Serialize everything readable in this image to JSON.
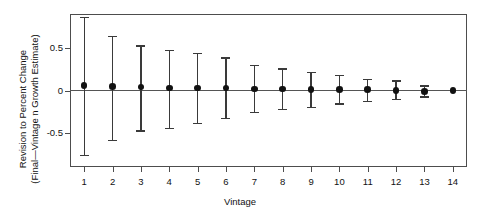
{
  "chart_data": {
    "type": "scatter",
    "title": "",
    "subtitle": "",
    "xlabel": "Vintage",
    "ylabel": "Revision to Percent Change (Final—Vintage n Growth Estimate)",
    "ylabel_line1": "Revision to Percent Change",
    "ylabel_line2": "(Final—Vintage n Growth Estimate)",
    "categories": [
      1,
      2,
      3,
      4,
      5,
      6,
      7,
      8,
      9,
      10,
      11,
      12,
      13,
      14
    ],
    "xtick_labels": [
      "1",
      "2",
      "3",
      "4",
      "5",
      "6",
      "7",
      "8",
      "9",
      "10",
      "11",
      "12",
      "13",
      "14"
    ],
    "ytick_labels": [
      "0.5",
      "0",
      "-0.5"
    ],
    "ytick_values": [
      0.5,
      0,
      -0.5
    ],
    "ylim": [
      -0.9,
      0.9
    ],
    "xlim": [
      0.5,
      14.5
    ],
    "grid": false,
    "legend": null,
    "zero_reference_line": 0,
    "series": [
      {
        "name": "Mean revision with error bars",
        "marker": "filled-circle",
        "values": [
          0.06,
          0.05,
          0.04,
          0.03,
          0.03,
          0.03,
          0.02,
          0.02,
          0.01,
          0.01,
          0.01,
          0.0,
          -0.01,
          0.0
        ],
        "error_upper": [
          0.87,
          0.64,
          0.53,
          0.48,
          0.44,
          0.39,
          0.3,
          0.26,
          0.22,
          0.18,
          0.14,
          0.12,
          0.06,
          0.0
        ],
        "error_lower": [
          -0.76,
          -0.58,
          -0.47,
          -0.44,
          -0.38,
          -0.32,
          -0.25,
          -0.22,
          -0.19,
          -0.15,
          -0.12,
          -0.1,
          -0.07,
          0.0
        ]
      }
    ]
  }
}
